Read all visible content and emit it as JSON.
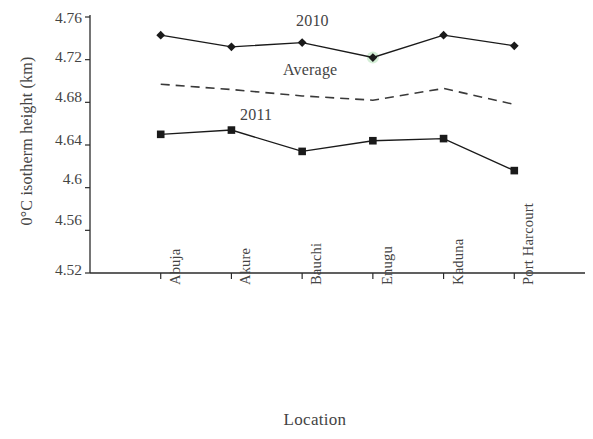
{
  "chart_data": {
    "type": "line",
    "title": "",
    "xlabel": "Location",
    "ylabel": "0°C isotherm height (km)",
    "categories": [
      "Abuja",
      "Akure",
      "Bauchi",
      "Enugu",
      "Kaduna",
      "Port Harcourt"
    ],
    "ylim": [
      4.52,
      4.76
    ],
    "ytick_labels": [
      "4.76",
      "4.72",
      "4.68",
      "4.64",
      "4.6",
      "4.56",
      "4.52"
    ],
    "ytick_values": [
      4.76,
      4.72,
      4.68,
      4.64,
      4.6,
      4.56,
      4.52
    ],
    "grid": false,
    "legend": "inline annotations",
    "series": [
      {
        "name": "2010",
        "values": [
          4.743,
          4.732,
          4.736,
          4.722,
          4.743,
          4.733
        ],
        "marker": "diamond",
        "line_style": "solid",
        "color": "#1a1a1a",
        "label_x_category": "Bauchi"
      },
      {
        "name": "Average",
        "values": [
          4.697,
          4.692,
          4.686,
          4.682,
          4.693,
          4.678
        ],
        "marker": "none",
        "line_style": "dashed",
        "color": "#3a3a3a",
        "label_x_category": "Bauchi"
      },
      {
        "name": "2011",
        "values": [
          4.65,
          4.654,
          4.634,
          4.644,
          4.646,
          4.616
        ],
        "marker": "square",
        "line_style": "solid",
        "color": "#1a1a1a",
        "label_x_category": "Akure"
      }
    ],
    "annotations": [
      {
        "text": "2010",
        "x": 296,
        "y": 23
      },
      {
        "text": "Average",
        "x": 283,
        "y": 72
      },
      {
        "text": "2011",
        "x": 240,
        "y": 117
      }
    ]
  },
  "axes": {
    "y_title": "0°C isotherm height (km)",
    "x_title": "Location",
    "y_ticks": [
      {
        "label": "4.76",
        "top": 10
      },
      {
        "label": "4.72",
        "top": 49
      },
      {
        "label": "4.68",
        "top": 89
      },
      {
        "label": "4.64",
        "top": 132
      },
      {
        "label": "4.6",
        "top": 171
      },
      {
        "label": "4.56",
        "top": 212
      },
      {
        "label": "4.52",
        "top": 262
      }
    ],
    "x_ticks": [
      {
        "label": "Abuja",
        "left": 140,
        "top": 286
      },
      {
        "label": "Akure",
        "left": 224,
        "top": 286
      },
      {
        "label": "Bauchi",
        "left": 308,
        "top": 286
      },
      {
        "label": "Enugu",
        "left": 392,
        "top": 286
      },
      {
        "label": "Kaduna",
        "left": 475,
        "top": 286
      },
      {
        "label": "Port Harcourt",
        "left": 559,
        "top": 286
      }
    ]
  }
}
